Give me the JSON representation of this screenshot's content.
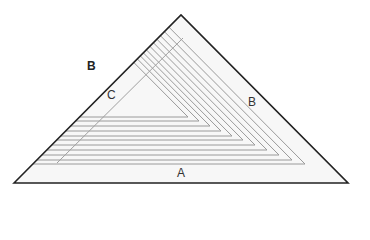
{
  "diagram": {
    "type": "nested-triangles",
    "labels": {
      "outer_left": "B",
      "inner_left": "C",
      "right": "B",
      "bottom": "A"
    },
    "outer_triangle": {
      "points": [
        [
          14,
          183
        ],
        [
          181,
          15
        ],
        [
          348,
          183
        ]
      ],
      "stroke": "#222222",
      "fill": "#f7f7f7"
    },
    "nested_shapes": {
      "stroke": "#9a9a9a",
      "bases": [
        {
          "y": 117,
          "right_x": 188
        },
        {
          "y": 121,
          "right_x": 199
        },
        {
          "y": 126,
          "right_x": 210
        },
        {
          "y": 131,
          "right_x": 221
        },
        {
          "y": 136,
          "right_x": 232
        },
        {
          "y": 140,
          "right_x": 243
        },
        {
          "y": 145,
          "right_x": 255
        },
        {
          "y": 150,
          "right_x": 267
        },
        {
          "y": 155,
          "right_x": 279
        },
        {
          "y": 160,
          "right_x": 292
        },
        {
          "y": 164,
          "right_x": 305
        }
      ]
    },
    "inner_diagonal": {
      "from": [
        57,
        163
      ],
      "to": [
        183,
        38
      ],
      "stroke": "#a0a0a0"
    }
  }
}
